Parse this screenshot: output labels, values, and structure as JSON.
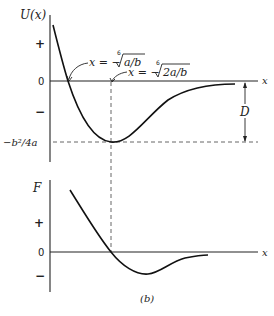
{
  "figure": {
    "caption": "(b)",
    "top_plot": {
      "ylabel": "U(x)",
      "xlabel": "x",
      "ticks": {
        "plus": "+",
        "zero": "0",
        "minus": "−",
        "min_value": "−b²/4a"
      },
      "annotation_zero_crossing": "x = −⁶√(a/b)",
      "annotation_zero_crossing_parts": {
        "lhs": "x = −",
        "index": "6",
        "radicand": "a/b"
      },
      "annotation_minimum_parts": {
        "lhs": "x = −",
        "index": "6",
        "radicand": "2a/b"
      },
      "depth_label": "D"
    },
    "bottom_plot": {
      "ylabel": "F",
      "xlabel": "x",
      "ticks": {
        "plus": "+",
        "zero": "0",
        "minus": "−"
      }
    }
  }
}
